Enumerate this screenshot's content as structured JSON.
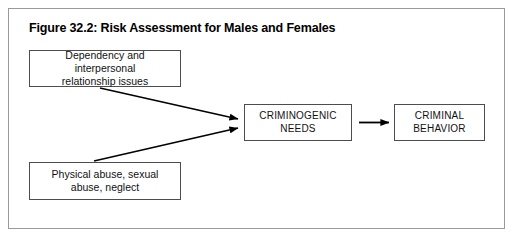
{
  "figure": {
    "title": "Figure 32.2: Risk Assessment for Males and Females",
    "frame_color": "#9a9a9a",
    "box_border_color": "#4d4d4d",
    "arrow_color": "#000000",
    "background_color": "#ffffff"
  },
  "diagram": {
    "type": "flowchart",
    "nodes": [
      {
        "id": "dependency",
        "label": "Dependency and interpersonal\nrelationship issues",
        "text_case": "sentence",
        "position": "top-left"
      },
      {
        "id": "abuse",
        "label": "Physical abuse, sexual\nabuse, neglect",
        "text_case": "sentence",
        "position": "bottom-left"
      },
      {
        "id": "criminogenic",
        "label": "CRIMINOGENIC\nNEEDS",
        "text_case": "upper",
        "position": "center"
      },
      {
        "id": "behavior",
        "label": "CRIMINAL\nBEHAVIOR",
        "text_case": "upper",
        "position": "right"
      }
    ],
    "edges": [
      {
        "id": "edge-dependency-to-criminogenic",
        "from": "dependency",
        "to": "criminogenic",
        "style": "solid-arrow"
      },
      {
        "id": "edge-abuse-to-criminogenic",
        "from": "abuse",
        "to": "criminogenic",
        "style": "solid-arrow"
      },
      {
        "id": "edge-criminogenic-to-behavior",
        "from": "criminogenic",
        "to": "behavior",
        "style": "solid-arrow"
      }
    ]
  }
}
